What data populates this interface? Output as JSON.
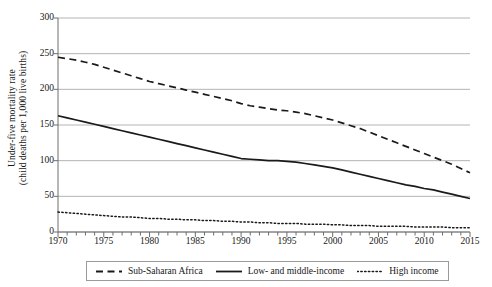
{
  "chart_data": {
    "type": "line",
    "title": "",
    "xlabel": "",
    "ylabel": "Under-five mortality rate (child deaths per 1,000 live births)",
    "ylabel_line1": "Under-five mortality rate",
    "ylabel_line2": "(child deaths per 1,000 live births)",
    "xlim": [
      1970,
      2015
    ],
    "ylim": [
      0,
      300
    ],
    "ytick_labels": [
      "300",
      "250",
      "200",
      "150",
      "100",
      "50",
      "0"
    ],
    "ytick_values": [
      300,
      250,
      200,
      150,
      100,
      50,
      0
    ],
    "xtick_labels": [
      "1970",
      "1975",
      "1980",
      "1985",
      "1990",
      "1995",
      "2000",
      "2005",
      "2010",
      "2015"
    ],
    "xtick_values": [
      1970,
      1975,
      1980,
      1985,
      1990,
      1995,
      2000,
      2005,
      2010,
      2015
    ],
    "minor_tick_interval": 1,
    "grid": "horizontal",
    "legend_position": "below-axis",
    "x": [
      1970,
      1971,
      1972,
      1973,
      1974,
      1975,
      1976,
      1977,
      1978,
      1979,
      1980,
      1981,
      1982,
      1983,
      1984,
      1985,
      1986,
      1987,
      1988,
      1989,
      1990,
      1991,
      1992,
      1993,
      1994,
      1995,
      1996,
      1997,
      1998,
      1999,
      2000,
      2001,
      2002,
      2003,
      2004,
      2005,
      2006,
      2007,
      2008,
      2009,
      2010,
      2011,
      2012,
      2013,
      2014,
      2015
    ],
    "series": [
      {
        "name": "Sub-Saharan Africa",
        "style": "dashed",
        "color": "#1a1a1a",
        "values": [
          245,
          243,
          241,
          238,
          235,
          231,
          227,
          223,
          219,
          215,
          211,
          208,
          205,
          202,
          199,
          196,
          193,
          190,
          187,
          184,
          180,
          177,
          175,
          173,
          171,
          170,
          168,
          166,
          163,
          160,
          157,
          153,
          149,
          145,
          140,
          135,
          130,
          125,
          120,
          115,
          110,
          105,
          100,
          95,
          89,
          83
        ]
      },
      {
        "name": "Low- and middle-income",
        "style": "solid",
        "color": "#1a1a1a",
        "values": [
          163,
          160,
          157,
          154,
          151,
          148,
          145,
          142,
          139,
          136,
          133,
          130,
          127,
          124,
          121,
          118,
          115,
          112,
          109,
          106,
          103,
          102,
          101,
          100,
          100,
          99,
          98,
          96,
          94,
          92,
          90,
          87,
          84,
          81,
          78,
          75,
          72,
          69,
          66,
          64,
          61,
          59,
          56,
          53,
          50,
          47
        ]
      },
      {
        "name": "High income",
        "style": "dotted",
        "color": "#1a1a1a",
        "values": [
          28,
          27,
          26,
          25,
          24,
          23,
          22,
          21,
          21,
          20,
          19,
          19,
          18,
          18,
          17,
          17,
          16,
          16,
          15,
          15,
          14,
          14,
          13,
          13,
          12,
          12,
          12,
          11,
          11,
          11,
          10,
          10,
          9,
          9,
          9,
          8,
          8,
          8,
          8,
          7,
          7,
          7,
          7,
          6,
          6,
          6
        ]
      }
    ]
  },
  "legend": {
    "items": [
      {
        "label": "Sub-Saharan Africa",
        "style": "dashed"
      },
      {
        "label": "Low- and middle-income",
        "style": "solid"
      },
      {
        "label": "High income",
        "style": "dotted"
      }
    ]
  },
  "colors": {
    "line": "#1a1a1a",
    "grid": "#b4b4b4",
    "axis": "#6e6e6e",
    "legend_border": "#9a9a9a",
    "background": "#ffffff"
  }
}
